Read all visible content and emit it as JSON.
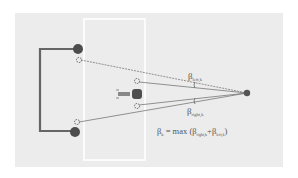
{
  "diagram": {
    "colors": {
      "background": "#ffffff",
      "panel": "#ececec",
      "field_outline": "#ffffff",
      "frame": "#666666",
      "dot": "#4d4d4d",
      "line": "#777777",
      "text": "#555555"
    },
    "labels": {
      "beta_left": "β",
      "beta_left_sub": "left,k",
      "beta_right": "β",
      "beta_right_sub": "right,k",
      "formula_lhs": "β",
      "formula_lhs_sub": "k",
      "formula_eq": " = max (",
      "formula_b1": "β",
      "formula_b1_sub": "right,k",
      "formula_plus": "+",
      "formula_b2": "β",
      "formula_b2_sub": "left,k",
      "formula_close": ")"
    },
    "points": {
      "goal_post_top": [
        78,
        49
      ],
      "goal_post_bottom": [
        75,
        132
      ],
      "marker_top": [
        79,
        60
      ],
      "marker_bottom": [
        77,
        122
      ],
      "vehicle": [
        137,
        94
      ],
      "vehicle_marker_top": [
        137,
        82
      ],
      "vehicle_marker_bottom": [
        137,
        106
      ],
      "observer": [
        247,
        93
      ]
    }
  }
}
